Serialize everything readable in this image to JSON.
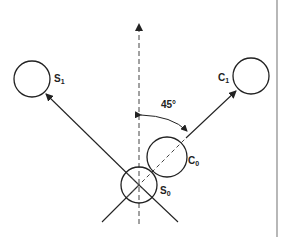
{
  "diagram": {
    "labels": {
      "s1": "S",
      "s1_sub": "1",
      "c1": "C",
      "c1_sub": "1",
      "c0": "C",
      "c0_sub": "0",
      "s0": "S",
      "s0_sub": "0",
      "angle": "45°"
    },
    "colors": {
      "stroke": "#222222",
      "divider": "#888888",
      "background": "#ffffff"
    }
  }
}
